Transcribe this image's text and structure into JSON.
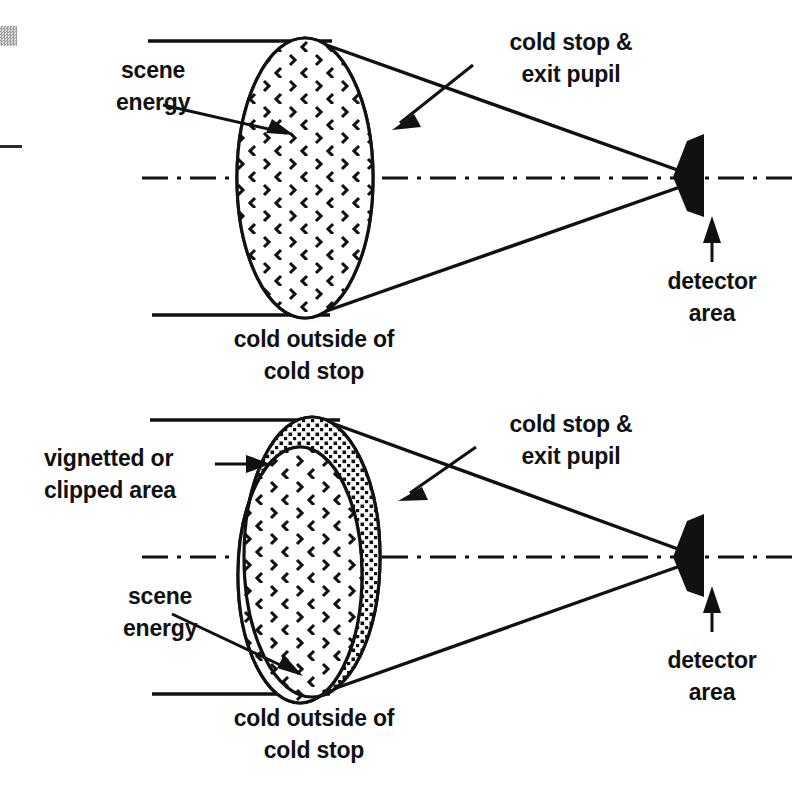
{
  "figure": {
    "colors": {
      "ink": "#111111",
      "background": "#ffffff",
      "artifact_gray": "#8d8d8d"
    }
  },
  "panels": [
    {
      "id": "top-panel",
      "name": "unvignetted-cold-stop-panel",
      "labels": {
        "scene_energy_line1": "scene",
        "scene_energy_line2": "energy",
        "cold_stop_line1": "cold stop &",
        "cold_stop_line2": "exit pupil",
        "detector_line1": "detector",
        "detector_line2": "area",
        "cold_outside_line1": "cold outside of",
        "cold_outside_line2": "cold stop"
      }
    },
    {
      "id": "bottom-panel",
      "name": "vignetted-cold-stop-panel",
      "labels": {
        "vignetted_line1": "vignetted or",
        "vignetted_line2": "clipped area",
        "cold_stop_line1": "cold stop &",
        "cold_stop_line2": "exit pupil",
        "scene_energy_line1": "scene",
        "scene_energy_line2": "energy",
        "detector_line1": "detector",
        "detector_line2": "area",
        "cold_outside_line1": "cold outside of",
        "cold_outside_line2": "cold stop"
      }
    }
  ],
  "elements": {
    "pupil_ellipse_name": "exit-pupil-ellipse",
    "scene_fill_name": "scene-energy-fill",
    "vignette_region_name": "vignetted-region",
    "detector_name": "detector-area-shape",
    "optical_axis_name": "optical-axis-centerline",
    "aperture_name": "cold-shield-aperture-line",
    "ray_name": "ray-bundle-line"
  }
}
